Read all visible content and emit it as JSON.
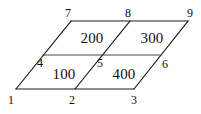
{
  "figure": {
    "background_color": "#ffffff",
    "line_color": "#1c1c1c",
    "inner_line_color": "#4a4a4a",
    "text_color": "#111111",
    "width": 201,
    "height": 114
  },
  "vertices": [
    {
      "label": "1",
      "x": 11,
      "y": 100
    },
    {
      "label": "2",
      "x": 72,
      "y": 100
    },
    {
      "label": "3",
      "x": 134,
      "y": 100
    },
    {
      "label": "4",
      "x": 40,
      "y": 63
    },
    {
      "label": "5",
      "x": 100,
      "y": 63
    },
    {
      "label": "6",
      "x": 165,
      "y": 64
    },
    {
      "label": "7",
      "x": 68,
      "y": 13
    },
    {
      "label": "8",
      "x": 128,
      "y": 13
    },
    {
      "label": "9",
      "x": 190,
      "y": 13
    }
  ],
  "cells": [
    {
      "label": "100",
      "x": 64,
      "y": 74,
      "corners": "1,2,5,4"
    },
    {
      "label": "400",
      "x": 124,
      "y": 74,
      "corners": "2,3,6,5"
    },
    {
      "label": "200",
      "x": 92,
      "y": 38,
      "corners": "4,5,8,7"
    },
    {
      "label": "300",
      "x": 152,
      "y": 38,
      "corners": "5,6,9,8"
    }
  ],
  "edges": {
    "outer_path": "M 16 89 L 134 89 L 188 21 L 71 21 Z",
    "bottom_edge": "M 16 89 L 134 89",
    "top_edge": "M 71 21 L 188 21",
    "left_edge": "M 16 89 L 71 21",
    "right_edge": "M 134 89 L 188 21",
    "middle_horizontal": "M 43 55 L 160 55",
    "diagonal_2_8": "M 75 89 L 130 21",
    "diagonal_3_9": "M 134 89 L 188 21"
  }
}
